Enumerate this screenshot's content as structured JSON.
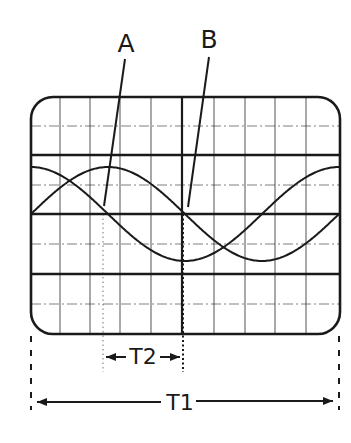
{
  "figure": {
    "type": "oscilloscope-phase-diagram",
    "ink_color": "#1a1a1a",
    "background": "#ffffff"
  },
  "labels": {
    "trace_a": "A",
    "trace_b": "B",
    "t2": "T2",
    "t1": "T1"
  },
  "screen": {
    "x": 31,
    "y": 97,
    "width": 309,
    "height": 237,
    "corner_radius": 22,
    "vertical_grid_x": [
      60,
      90,
      120,
      151,
      182,
      214,
      245,
      275,
      306
    ],
    "center_vertical_x": 182,
    "thick_horizontal_y": [
      155,
      214,
      274
    ],
    "thin_horizontal_y": [
      126,
      185,
      244,
      304
    ]
  },
  "traces": [
    {
      "name": "A",
      "description": "leading sine trace",
      "center_y": 214,
      "amplitude_px": 47,
      "period_px": 308,
      "start_x": 31,
      "end_x": 339,
      "phase_deg": 0
    },
    {
      "name": "B",
      "description": "trace shifted ~90 degrees",
      "center_y": 214,
      "amplitude_px": 47,
      "period_px": 308,
      "start_x": 31,
      "end_x": 339,
      "phase_deg": 90
    }
  ],
  "annotations": {
    "t2": {
      "from_x": 103,
      "to_x": 183,
      "arrow_y": 357,
      "label": "T2",
      "meaning": "phase difference time"
    },
    "t1": {
      "from_x": 31,
      "to_x": 339,
      "arrow_y": 402,
      "label": "T1",
      "meaning": "one full period"
    }
  }
}
